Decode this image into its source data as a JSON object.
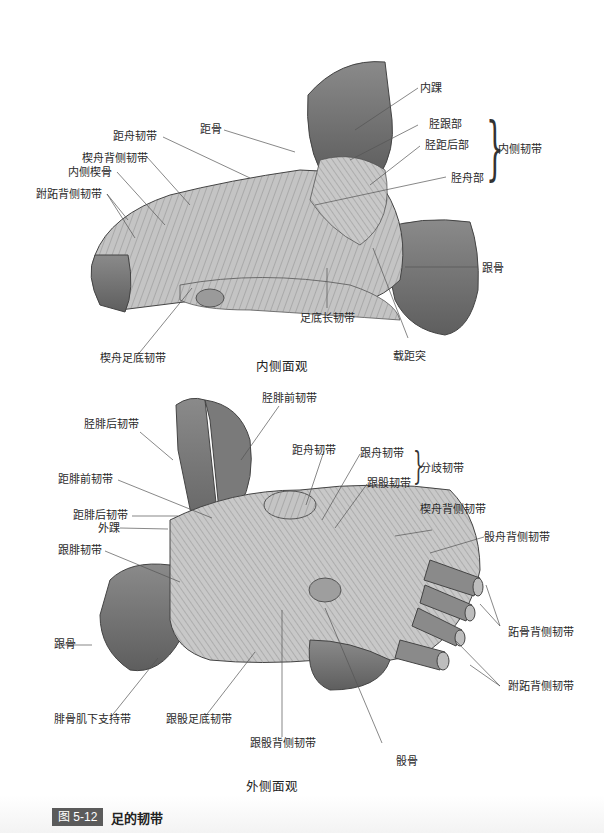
{
  "medial_view": {
    "caption": "内侧面观",
    "labels": {
      "medial_malleolus": "内踝",
      "talus": "距骨",
      "talonavicular_lig": "距舟韧带",
      "cuneonavicular_dorsal": "楔舟背侧韧带",
      "medial_cuneiform": "内侧楔骨",
      "tarsometatarsal_dorsal": "跗跖背侧韧带",
      "tibiocalcaneal": "胫跟部",
      "posterior_tibiotalar": "胫距后部",
      "tibionavicular": "胫舟部",
      "medial_ligament_group": "内侧韧带",
      "calcaneus": "跟骨",
      "long_plantar_lig": "足底长韧带",
      "cuneonavicular_plantar": "楔舟足底韧带",
      "sustentaculum_tali": "载距突"
    }
  },
  "lateral_view": {
    "caption": "外侧面观",
    "labels": {
      "anterior_tibiofibular": "胫腓前韧带",
      "posterior_tibiofibular": "胫腓后韧带",
      "talonavicular_lig": "距舟韧带",
      "calcaneonavicular": "跟舟韧带",
      "calcaneocuboid": "跟骰韧带",
      "bifurcate_lig_group": "分歧韧带",
      "anterior_talofibular": "距腓前韧带",
      "posterior_talofibular": "距腓后韧带",
      "lateral_malleolus": "外踝",
      "cuneonavicular_dorsal": "楔舟背侧韧带",
      "cuboideonavicular_dorsal": "骰舟背侧韧带",
      "calcaneofibular": "跟腓韧带",
      "metatarsal_dorsal": "跖骨背侧韧带",
      "calcaneus": "跟骨",
      "tarsometatarsal_dorsal": "跗跖背侧韧带",
      "inferior_peroneal_retinaculum": "腓骨肌下支持带",
      "calcaneocuboid_plantar": "跟骰足底韧带",
      "calcaneocuboid_dorsal": "跟骰背侧韧带",
      "cuboid": "骰骨"
    }
  },
  "caption": {
    "figure_number": "图 5-12",
    "title": "足的韧带"
  },
  "colors": {
    "bone_dark": "#6e6e6e",
    "bone_mid": "#8c8c8c",
    "ligament": "#c9c9c9",
    "badge": "#5b5b5b"
  }
}
